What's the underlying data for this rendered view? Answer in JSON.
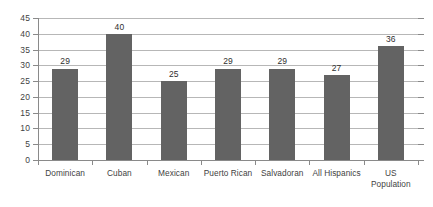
{
  "chart_data": {
    "type": "bar",
    "title": "",
    "subtitle": "",
    "xlabel": "",
    "ylabel": "",
    "categories": [
      "Dominican",
      "Cuban",
      "Mexican",
      "Puerto Rican",
      "Salvadoran",
      "All Hispanics",
      "US\nPopulation"
    ],
    "values": [
      29,
      40,
      25,
      29,
      29,
      27,
      36
    ],
    "value_labels": [
      "29",
      "40",
      "25",
      "29",
      "29",
      "27",
      "36"
    ],
    "ylim": [
      0,
      45
    ],
    "ytick_labels": [
      "0",
      "5",
      "10",
      "15",
      "20",
      "25",
      "30",
      "35",
      "40",
      "45"
    ],
    "ytick_values": [
      0,
      5,
      10,
      15,
      20,
      25,
      30,
      35,
      40,
      45
    ],
    "grid": true,
    "grid_axis": "y",
    "legend": false,
    "legend_position": "none",
    "bar_color": "#636363",
    "grid_color": "#b7b7b7",
    "axis_color": "#8a8a8a",
    "text_color": "#3f3f3f",
    "background_color": "#ffffff"
  }
}
